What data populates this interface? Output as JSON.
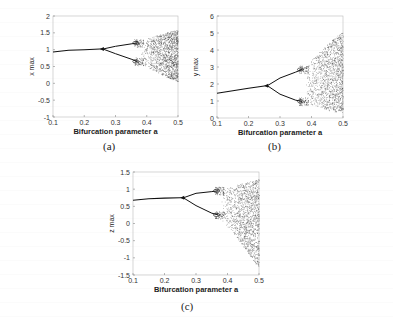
{
  "chart_data": [
    {
      "id": "a",
      "type": "scatter",
      "title": "",
      "caption": "(a)",
      "xlabel": "Bifurcation parameter a",
      "ylabel": "x max",
      "xlim": [
        0.1,
        0.5
      ],
      "ylim": [
        -1,
        2
      ],
      "xticks": [
        "0.1",
        "0.2",
        "0.3",
        "0.4",
        "0.5"
      ],
      "yticks": [
        "-1",
        "-0.5",
        "0",
        "0.5",
        "1",
        "1.5",
        "2"
      ],
      "grid": false,
      "legend": null,
      "description": "Period-doubling bifurcation diagram; single branch ~0.95-1.0 until a≈0.26, splits into two branches (~1.2 and ~0.65 at a≈0.37), further doubling at ≈0.37, chaos from ≈0.38 spreading to range ~0 to 1.6 at a=0.5",
      "branches": {
        "stable": [
          [
            0.1,
            0.93
          ],
          [
            0.15,
            0.98
          ],
          [
            0.2,
            1.0
          ],
          [
            0.25,
            1.02
          ],
          [
            0.26,
            1.02
          ]
        ],
        "upper": [
          [
            0.26,
            1.02
          ],
          [
            0.3,
            1.1
          ],
          [
            0.35,
            1.17
          ],
          [
            0.37,
            1.2
          ]
        ],
        "lower": [
          [
            0.26,
            1.02
          ],
          [
            0.3,
            0.88
          ],
          [
            0.35,
            0.72
          ],
          [
            0.37,
            0.65
          ]
        ],
        "chaos_envelope": [
          [
            0.38,
            1.25,
            0.55
          ],
          [
            0.42,
            1.4,
            0.4
          ],
          [
            0.46,
            1.5,
            0.2
          ],
          [
            0.5,
            1.6,
            0.05
          ]
        ]
      }
    },
    {
      "id": "b",
      "type": "scatter",
      "title": "",
      "caption": "(b)",
      "xlabel": "Bifurcation parameter a",
      "ylabel": "y max",
      "xlim": [
        0.1,
        0.5
      ],
      "ylim": [
        0,
        6
      ],
      "xticks": [
        "0.1",
        "0.2",
        "0.3",
        "0.4",
        "0.5"
      ],
      "yticks": [
        "0",
        "1",
        "2",
        "3",
        "4",
        "5",
        "6"
      ],
      "grid": false,
      "legend": null,
      "description": "Single branch rising from ~1.5 to ~1.9 at a≈0.26, splits into upper (~2.8 at 0.37) and lower (~1.0 at 0.37) branches, chaos region widens to range ~0.3 to 5.1 at a=0.5",
      "branches": {
        "stable": [
          [
            0.1,
            1.45
          ],
          [
            0.15,
            1.6
          ],
          [
            0.2,
            1.75
          ],
          [
            0.25,
            1.88
          ],
          [
            0.26,
            1.9
          ]
        ],
        "upper": [
          [
            0.26,
            1.9
          ],
          [
            0.3,
            2.35
          ],
          [
            0.35,
            2.7
          ],
          [
            0.37,
            2.85
          ]
        ],
        "lower": [
          [
            0.26,
            1.9
          ],
          [
            0.3,
            1.4
          ],
          [
            0.35,
            1.05
          ],
          [
            0.37,
            0.98
          ]
        ],
        "chaos_envelope": [
          [
            0.38,
            3.0,
            0.9
          ],
          [
            0.42,
            3.8,
            0.7
          ],
          [
            0.46,
            4.5,
            0.4
          ],
          [
            0.5,
            5.1,
            0.3
          ]
        ]
      }
    },
    {
      "id": "c",
      "type": "scatter",
      "title": "",
      "caption": "(c)",
      "xlabel": "Bifurcation parameter a",
      "ylabel": "z max",
      "xlim": [
        0.1,
        0.5
      ],
      "ylim": [
        -1.5,
        1.5
      ],
      "xticks": [
        "0.1",
        "0.2",
        "0.3",
        "0.4",
        "0.5"
      ],
      "yticks": [
        "-1.5",
        "-1",
        "-0.5",
        "0",
        "0.5",
        "1",
        "1.5"
      ],
      "grid": false,
      "legend": null,
      "description": "Single branch ~0.7-0.75 until a≈0.26, splits into upper (~0.95 at 0.37) and lower (~0.25 at 0.37) branches, chaos region spreads to range ~-1.3 to 1.3 at a=0.5",
      "branches": {
        "stable": [
          [
            0.1,
            0.68
          ],
          [
            0.15,
            0.72
          ],
          [
            0.2,
            0.74
          ],
          [
            0.25,
            0.75
          ],
          [
            0.26,
            0.75
          ]
        ],
        "upper": [
          [
            0.26,
            0.75
          ],
          [
            0.3,
            0.88
          ],
          [
            0.35,
            0.93
          ],
          [
            0.37,
            0.95
          ]
        ],
        "lower": [
          [
            0.26,
            0.75
          ],
          [
            0.3,
            0.52
          ],
          [
            0.35,
            0.3
          ],
          [
            0.37,
            0.25
          ]
        ],
        "chaos_envelope": [
          [
            0.38,
            1.0,
            0.1
          ],
          [
            0.42,
            1.1,
            -0.3
          ],
          [
            0.46,
            1.2,
            -0.8
          ],
          [
            0.5,
            1.3,
            -1.3
          ]
        ]
      }
    }
  ]
}
